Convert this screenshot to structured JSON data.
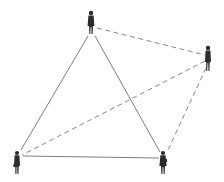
{
  "diagram": {
    "type": "social-network",
    "colors": {
      "background": "#ffffff",
      "solid_line": "#6e6e6e",
      "dashed_line": "#7a7a7a",
      "figure": "#2b2b2b"
    },
    "nodes": [
      {
        "id": "top",
        "label": "",
        "icon": "person-icon",
        "x": 91,
        "y": 22
      },
      {
        "id": "right",
        "label": "",
        "icon": "person-icon",
        "x": 208,
        "y": 58
      },
      {
        "id": "bottom-left",
        "label": "",
        "icon": "person-icon",
        "x": 17,
        "y": 162
      },
      {
        "id": "bottom-right",
        "label": "",
        "icon": "person-icon",
        "x": 163,
        "y": 162
      }
    ],
    "edges": [
      {
        "from": "top",
        "to": "bottom-left",
        "style": "solid"
      },
      {
        "from": "top",
        "to": "bottom-right",
        "style": "solid"
      },
      {
        "from": "bottom-left",
        "to": "bottom-right",
        "style": "solid"
      },
      {
        "from": "top",
        "to": "right",
        "style": "dashed"
      },
      {
        "from": "right",
        "to": "bottom-left",
        "style": "dashed"
      },
      {
        "from": "right",
        "to": "bottom-right",
        "style": "dashed"
      }
    ]
  }
}
